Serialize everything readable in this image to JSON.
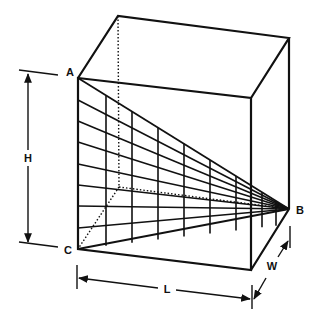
{
  "diagram": {
    "type": "perspective-box",
    "labels": {
      "A": "A",
      "B": "B",
      "C": "C",
      "H": "H",
      "L": "L",
      "W": "W"
    },
    "colors": {
      "stroke": "#111111",
      "background": "#ffffff"
    },
    "points": {
      "A": [
        78,
        78
      ],
      "B": [
        289,
        209
      ],
      "C": [
        78,
        249
      ],
      "front_top_right": [
        251,
        98
      ],
      "front_bottom_right": [
        251,
        270
      ],
      "back_top_left": [
        118,
        16
      ],
      "back_top_right": [
        289,
        38
      ],
      "back_bottom_left_hidden": [
        119,
        187
      ]
    },
    "grid": {
      "horizontal_divisions": 8,
      "vertical_lines_x": [
        106,
        132,
        158,
        184,
        210,
        236,
        262,
        276
      ]
    },
    "dimensions": {
      "H": {
        "label": "H",
        "from": [
          28,
          72
        ],
        "to": [
          28,
          243
        ]
      },
      "L": {
        "label": "L",
        "from": [
          80,
          277
        ],
        "to": [
          250,
          298
        ]
      },
      "W": {
        "label": "W",
        "from": [
          254,
          300
        ],
        "to": [
          287,
          242
        ]
      }
    }
  }
}
